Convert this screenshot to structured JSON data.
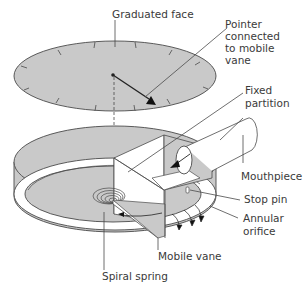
{
  "diagram": {
    "colors": {
      "face_fill": "#c9c9c9",
      "outline": "#4a4a4a",
      "text": "#3a3a3a",
      "white": "#ffffff"
    },
    "labels": {
      "graduated_face": "Graduated face",
      "pointer_line1": "Pointer",
      "pointer_line2": "connected",
      "pointer_line3": "to mobile",
      "pointer_line4": "vane",
      "fixed_partition_line1": "Fixed",
      "fixed_partition_line2": "partition",
      "mouthpiece": "Mouthpiece",
      "stop_pin": "Stop pin",
      "annular_orifice_line1": "Annular",
      "annular_orifice_line2": "orifice",
      "mobile_vane": "Mobile vane",
      "spiral_spring": "Spiral spring"
    }
  }
}
